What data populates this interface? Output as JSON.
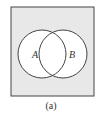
{
  "diagram": {
    "type": "venn",
    "sets": [
      {
        "label": "A"
      },
      {
        "label": "B"
      }
    ],
    "caption": "(a)",
    "colors": {
      "universe_fill": "#e8e8e8",
      "circle_fill": "#ffffff",
      "stroke": "#444444"
    }
  }
}
